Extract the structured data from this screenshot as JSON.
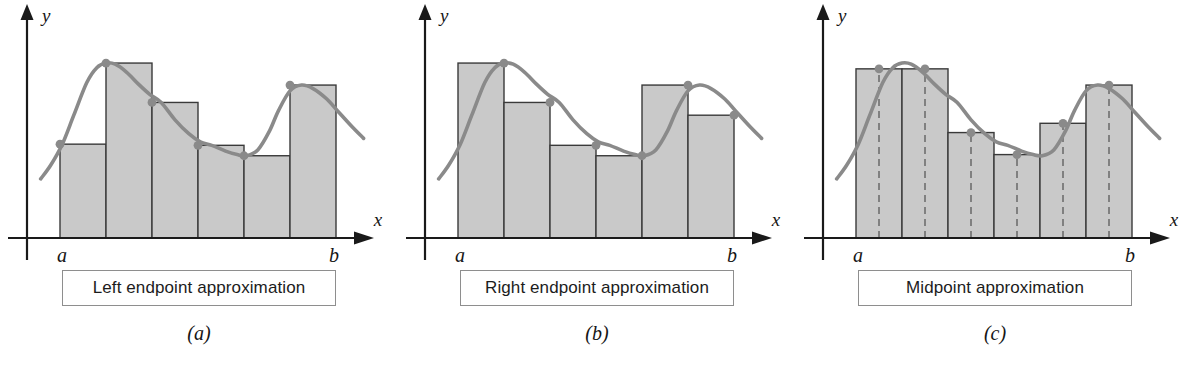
{
  "figure": {
    "background_color": "#ffffff"
  },
  "style": {
    "bar_fill": "#c9c9c9",
    "bar_stroke": "#3a3a3a",
    "curve_color": "#8a8a8a",
    "dot_color": "#8a8a8a",
    "axis_color": "#1a1a1a",
    "dash_color": "#6e6e6e",
    "caption_border": "#8e8e8e",
    "text_color": "#161616"
  },
  "panels": [
    {
      "id": "a",
      "letter": "(a)",
      "caption": "Left endpoint approximation",
      "method": "left",
      "y_axis_label": "y",
      "x_axis_label": "x",
      "left_tick_label": "a",
      "right_tick_label": "b",
      "chart_data": {
        "type": "bar",
        "title": "Left endpoint approximation",
        "xlabel": "x",
        "ylabel": "y",
        "grid": false,
        "legend": null,
        "n_subintervals": 6,
        "sample_rule": "left",
        "x_edges": [
          0,
          1,
          2,
          3,
          4,
          5,
          6
        ],
        "xlim": [
          -0.75,
          7.0
        ],
        "ylim": [
          0,
          10
        ],
        "bar_heights": [
          4.05,
          7.55,
          5.85,
          4.0,
          3.55,
          6.6
        ],
        "sample_points_x": [
          0,
          1,
          2,
          3,
          4,
          5
        ],
        "sample_points_y": [
          4.05,
          7.55,
          5.85,
          4.0,
          3.55,
          6.6
        ],
        "curve": {
          "name": "f(x)",
          "x": [
            -0.42,
            -0.2,
            0.05,
            0.3,
            0.58,
            0.8,
            1.0,
            1.2,
            1.45,
            1.7,
            1.95,
            2.2,
            2.5,
            2.8,
            3.05,
            3.3,
            3.6,
            3.85,
            4.05,
            4.3,
            4.55,
            4.75,
            5.0,
            5.25,
            5.5,
            5.8,
            6.05,
            6.35,
            6.6
          ],
          "y": [
            2.55,
            3.15,
            4.05,
            5.3,
            6.7,
            7.35,
            7.55,
            7.5,
            7.15,
            6.65,
            6.2,
            5.85,
            5.1,
            4.5,
            4.15,
            4.0,
            3.75,
            3.6,
            3.55,
            3.8,
            4.6,
            5.5,
            6.35,
            6.6,
            6.45,
            6.0,
            5.45,
            4.8,
            4.3
          ]
        }
      }
    },
    {
      "id": "b",
      "letter": "(b)",
      "caption": "Right endpoint approximation",
      "method": "right",
      "y_axis_label": "y",
      "x_axis_label": "x",
      "left_tick_label": "a",
      "right_tick_label": "b",
      "chart_data": {
        "type": "bar",
        "title": "Right endpoint approximation",
        "xlabel": "x",
        "ylabel": "y",
        "grid": false,
        "legend": null,
        "n_subintervals": 6,
        "sample_rule": "right",
        "x_edges": [
          0,
          1,
          2,
          3,
          4,
          5,
          6
        ],
        "xlim": [
          -0.75,
          7.0
        ],
        "ylim": [
          0,
          10
        ],
        "bar_heights": [
          7.55,
          5.85,
          4.0,
          3.55,
          6.6,
          5.3
        ],
        "sample_points_x": [
          1,
          2,
          3,
          4,
          5,
          6
        ],
        "sample_points_y": [
          7.55,
          5.85,
          4.0,
          3.55,
          6.6,
          5.3
        ],
        "curve": {
          "name": "f(x)",
          "x": [
            -0.42,
            -0.2,
            0.05,
            0.3,
            0.58,
            0.8,
            1.0,
            1.2,
            1.45,
            1.7,
            1.95,
            2.2,
            2.5,
            2.8,
            3.05,
            3.3,
            3.6,
            3.85,
            4.05,
            4.3,
            4.55,
            4.75,
            5.0,
            5.25,
            5.5,
            5.8,
            6.05,
            6.35,
            6.6
          ],
          "y": [
            2.55,
            3.15,
            4.05,
            5.3,
            6.7,
            7.35,
            7.55,
            7.5,
            7.15,
            6.65,
            6.2,
            5.85,
            5.1,
            4.5,
            4.15,
            4.0,
            3.75,
            3.6,
            3.55,
            3.8,
            4.6,
            5.5,
            6.35,
            6.6,
            6.45,
            6.0,
            5.45,
            4.8,
            4.3
          ]
        }
      }
    },
    {
      "id": "c",
      "letter": "(c)",
      "caption": "Midpoint approximation",
      "method": "midpoint",
      "y_axis_label": "y",
      "x_axis_label": "x",
      "left_tick_label": "a",
      "right_tick_label": "b",
      "chart_data": {
        "type": "bar",
        "title": "Midpoint approximation",
        "xlabel": "x",
        "ylabel": "y",
        "grid": false,
        "legend": null,
        "n_subintervals": 6,
        "sample_rule": "midpoint",
        "x_edges": [
          0,
          1,
          2,
          3,
          4,
          5,
          6
        ],
        "xlim": [
          -0.75,
          7.0
        ],
        "ylim": [
          0,
          10
        ],
        "bar_heights": [
          7.3,
          7.3,
          4.55,
          3.6,
          4.95,
          6.6
        ],
        "sample_points_x": [
          0.5,
          1.5,
          2.5,
          3.5,
          4.5,
          5.5
        ],
        "sample_points_y": [
          7.3,
          7.3,
          4.55,
          3.6,
          4.95,
          6.6
        ],
        "midpoint_dashes_x": [
          0.5,
          1.5,
          2.5,
          3.5,
          4.5,
          5.5
        ],
        "curve": {
          "name": "f(x)",
          "x": [
            -0.42,
            -0.2,
            0.05,
            0.3,
            0.58,
            0.8,
            1.0,
            1.2,
            1.45,
            1.7,
            1.95,
            2.2,
            2.5,
            2.8,
            3.05,
            3.3,
            3.6,
            3.85,
            4.05,
            4.3,
            4.55,
            4.75,
            5.0,
            5.25,
            5.5,
            5.8,
            6.05,
            6.35,
            6.6
          ],
          "y": [
            2.55,
            3.15,
            4.05,
            5.3,
            6.7,
            7.35,
            7.55,
            7.5,
            7.15,
            6.65,
            6.2,
            5.85,
            5.1,
            4.5,
            4.15,
            4.0,
            3.75,
            3.6,
            3.55,
            3.8,
            4.6,
            5.5,
            6.35,
            6.6,
            6.45,
            6.0,
            5.45,
            4.8,
            4.3
          ]
        }
      }
    }
  ]
}
